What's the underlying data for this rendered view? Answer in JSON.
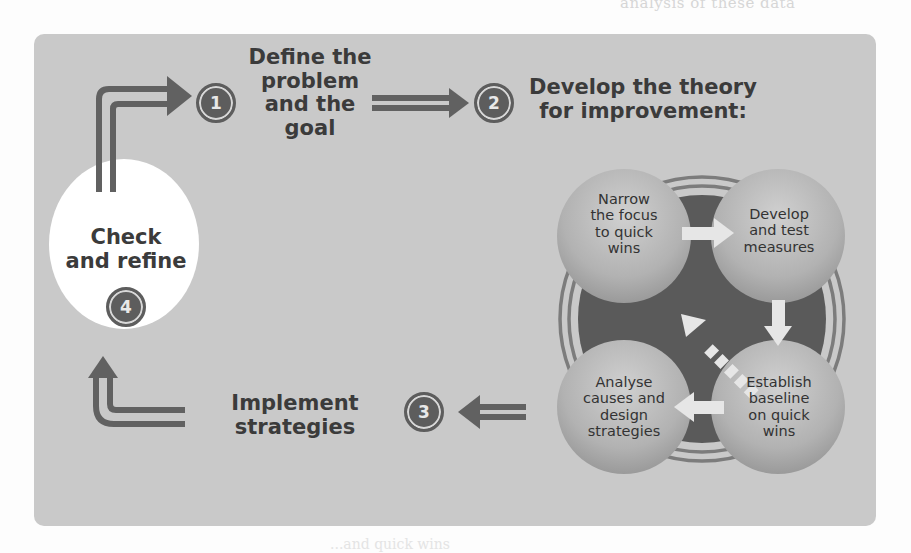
{
  "page": {
    "fragment_top": "analysis of these data",
    "fragment_bottom": "...and quick wins"
  },
  "colors": {
    "panel_background": "#c9c9c9",
    "arrow_dark": "#616161",
    "cycle_core": "#5a5a5a",
    "bubble": "#b3b3b3",
    "check_ellipse": "#ffffff"
  },
  "steps": [
    {
      "number": "1",
      "title_lines": [
        "Define the",
        "problem",
        "and the goal"
      ]
    },
    {
      "number": "2",
      "title_lines": [
        "Develop the theory",
        "for improvement:"
      ]
    },
    {
      "number": "3",
      "title_lines": [
        "Implement",
        "strategies"
      ]
    },
    {
      "number": "4",
      "title_lines": [
        "Check",
        "and refine"
      ]
    }
  ],
  "cycle": {
    "items": [
      {
        "position": "top-left",
        "lines": [
          "Narrow",
          "the focus",
          "to quick",
          "wins"
        ]
      },
      {
        "position": "top-right",
        "lines": [
          "Develop",
          "and test",
          "measures"
        ]
      },
      {
        "position": "bottom-right",
        "lines": [
          "Establish",
          "baseline",
          "on quick",
          "wins"
        ]
      },
      {
        "position": "bottom-left",
        "lines": [
          "Analyse",
          "causes and",
          "design",
          "strategies"
        ]
      }
    ],
    "arrows": [
      "right",
      "down",
      "left",
      "dashed-diagonal-up-left"
    ]
  }
}
